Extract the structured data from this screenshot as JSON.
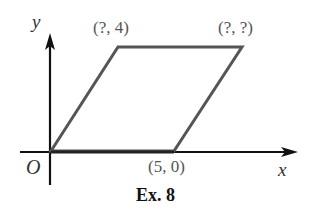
{
  "diagram": {
    "axes": {
      "x_label": "x",
      "y_label": "y",
      "origin_label": "O"
    },
    "shape": "parallelogram",
    "vertices": [
      {
        "name": "origin",
        "label": "O",
        "coords": "(0, 0)"
      },
      {
        "name": "bottom-right",
        "label": "(5, 0)"
      },
      {
        "name": "top-right",
        "label": "(?, ?)"
      },
      {
        "name": "top-left",
        "label": "(?, 4)"
      }
    ],
    "labels": {
      "top_left": "(?, 4)",
      "top_right": "(?, ?)",
      "bottom_right": "(5, 0)"
    },
    "caption": "Ex. 8",
    "colors": {
      "axis": "#111111",
      "shape": "#555555",
      "text": "#555555"
    }
  }
}
